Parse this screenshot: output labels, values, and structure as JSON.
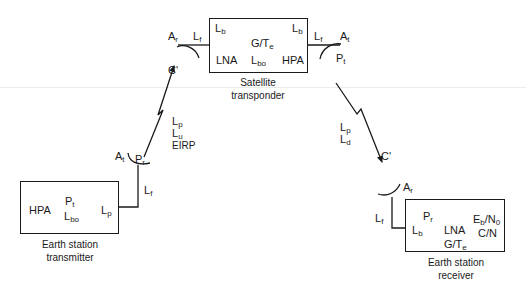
{
  "diagram": {
    "type": "satellite-link-budget-block-diagram",
    "line_color": "#1a1a1a",
    "satellite": {
      "caption_line1": "Satellite",
      "caption_line2": "transponder",
      "inside": {
        "lb_left": {
          "base": "L",
          "sub": "b"
        },
        "lb_right": {
          "base": "L",
          "sub": "b"
        },
        "g_over_te": {
          "base": "G/T",
          "sub": "e"
        },
        "lna": "LNA",
        "lbo": {
          "base": "L",
          "sub": "bo"
        },
        "hpa": "HPA"
      },
      "rx_side": {
        "antenna_gain": {
          "base": "A",
          "sub": "r"
        },
        "feeder_loss": {
          "base": "L",
          "sub": "f"
        },
        "carrier": "C'"
      },
      "tx_side": {
        "feeder_loss": {
          "base": "L",
          "sub": "f"
        },
        "antenna_gain": {
          "base": "A",
          "sub": "t"
        },
        "power": {
          "base": "P",
          "sub": "t"
        }
      }
    },
    "uplink": {
      "path_loss": {
        "base": "L",
        "sub": "p"
      },
      "uplink_loss": {
        "base": "L",
        "sub": "u"
      },
      "eirp": "EIRP"
    },
    "downlink": {
      "path_loss": {
        "base": "L",
        "sub": "p"
      },
      "downlink_loss": {
        "base": "L",
        "sub": "d"
      },
      "carrier": "C'"
    },
    "earth_transmitter": {
      "caption_line1": "Earth station",
      "caption_line2": "transmitter",
      "inside": {
        "hpa": "HPA",
        "pt": {
          "base": "P",
          "sub": "t"
        },
        "lbo": {
          "base": "L",
          "sub": "bo"
        },
        "lp": {
          "base": "L",
          "sub": "p"
        }
      },
      "antenna_gain": {
        "base": "A",
        "sub": "t"
      },
      "power": {
        "base": "P",
        "sub": "r"
      },
      "feeder_loss": {
        "base": "L",
        "sub": "f"
      }
    },
    "earth_receiver": {
      "caption_line1": "Earth station",
      "caption_line2": "receiver",
      "inside": {
        "pr": {
          "base": "P",
          "sub": "r"
        },
        "lb": {
          "base": "L",
          "sub": "b"
        },
        "lna": "LNA",
        "g_over_te": {
          "base": "G/T",
          "sub": "e"
        },
        "eb_n0": {
          "base1": "E",
          "sub1": "b",
          "mid": "/N",
          "sub2": "0"
        },
        "cn": "C/N"
      },
      "antenna_gain": {
        "base": "A",
        "sub": "r"
      },
      "feeder_loss": {
        "base": "L",
        "sub": "f"
      }
    }
  }
}
